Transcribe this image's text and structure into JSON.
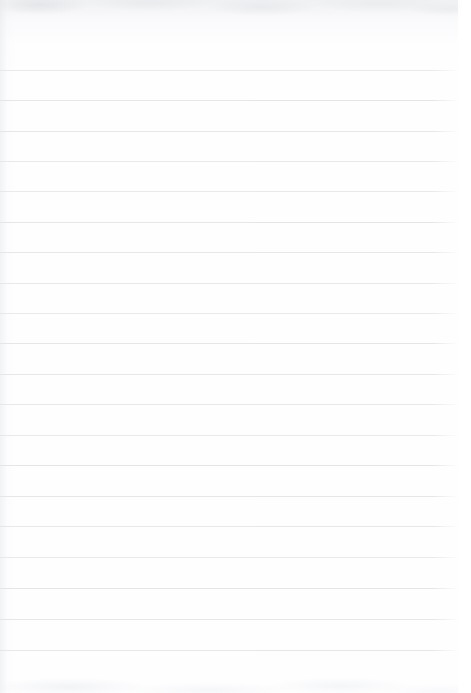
{
  "document": {
    "kind": "lined-paper-scan",
    "title": "Blank ruled notebook page",
    "description": "A scanned blank sheet of ruled writing paper. No handwriting, no printed text, no header, no page number.",
    "orientation": "portrait",
    "page_width_px": 471,
    "page_height_px": 693,
    "paper_color": "#fefeff",
    "content_text": "",
    "handwriting_present": "none",
    "printed_text_present": "none"
  },
  "ruling": {
    "line_color": "#e3e5e7",
    "line_thickness_px": 1,
    "line_spacing_px": 30,
    "first_line_y_px": 70,
    "last_line_y_px": 650,
    "line_start_x_px": 0,
    "line_end_x_px": 458,
    "line_count": 20,
    "margin_rule_present": "none",
    "top_margin_px": 70,
    "bottom_margin_px": 43,
    "right_margin_px": 13,
    "lines_y": [
      70,
      100,
      131,
      161,
      191,
      222,
      252,
      283,
      313,
      343,
      374,
      404,
      435,
      465,
      496,
      526,
      557,
      588,
      619,
      650
    ]
  },
  "scan_artifacts": {
    "top_edge_shading": "#e4e6e9",
    "left_edge_shading": "#e2e5e8",
    "bottom_edge_mottling": "#e2e5e8",
    "right_edge_highlight": "#ffffff"
  }
}
